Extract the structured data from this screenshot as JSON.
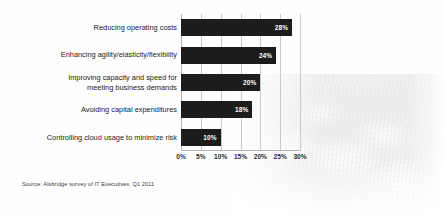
{
  "source_note": "Source: Alsbridge survey of IT Executives, Q1 2011",
  "chart_data": {
    "type": "bar",
    "orientation": "horizontal",
    "title": "",
    "subtitle": "",
    "xlabel": "",
    "ylabel": "",
    "xlim": [
      0,
      30
    ],
    "xtick_labels": [
      "0%",
      "5%",
      "10%",
      "15%",
      "20%",
      "25%",
      "30%"
    ],
    "xtick_values": [
      0,
      5,
      10,
      15,
      20,
      25,
      30
    ],
    "grid": true,
    "legend": false,
    "bar_color": "#1c1c1c",
    "value_label_color": "#ffffff",
    "categories": [
      "Reducing operating costs",
      "Enhancing agility/elasticity/flexibility",
      "Improving capacity and speed for\nmeeting business demands",
      "Avoiding capital expenditures",
      "Controlling cloud usage to minimize risk"
    ],
    "values": [
      28,
      24,
      20,
      18,
      10
    ],
    "data_labels": [
      "28%",
      "24%",
      "20%",
      "18%",
      "10%"
    ]
  }
}
